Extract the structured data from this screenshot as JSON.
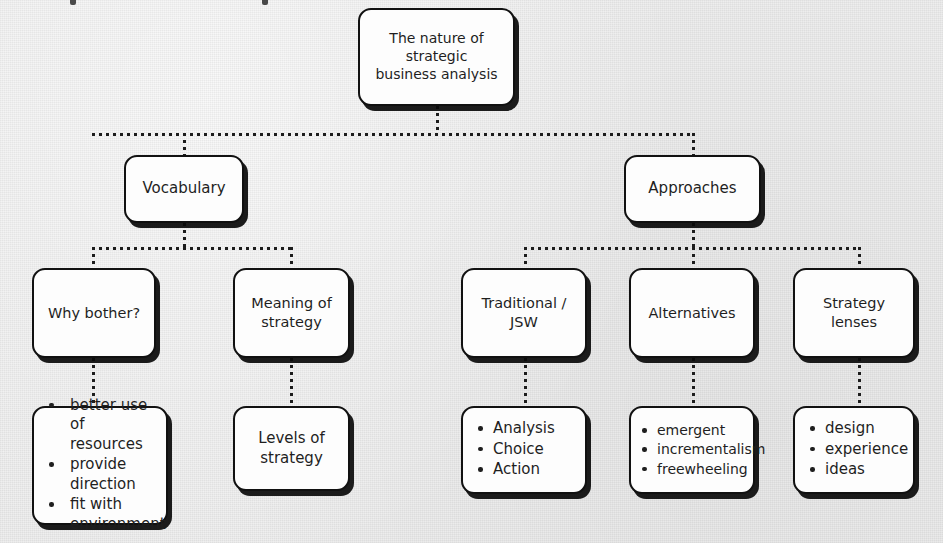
{
  "diagram": {
    "background_color": "#ededed",
    "node_fill": "#fdfdfd",
    "node_border_color": "#111111",
    "connector_style": "dotted",
    "root": {
      "label": "The nature of\nstrategic\nbusiness analysis"
    },
    "branches": {
      "vocabulary": {
        "label": "Vocabulary"
      },
      "approaches": {
        "label": "Approaches"
      }
    },
    "level3": {
      "why_bother": {
        "label": "Why bother?"
      },
      "meaning_of_strategy": {
        "label": "Meaning of\nstrategy"
      },
      "traditional_jsw": {
        "label": "Traditional / JSW"
      },
      "alternatives": {
        "label": "Alternatives"
      },
      "strategy_lenses": {
        "label": "Strategy lenses"
      }
    },
    "leaves": {
      "why_bother_points": {
        "items": [
          "better use of resources",
          "provide direction",
          "fit with environment"
        ]
      },
      "levels_of_strategy": {
        "label": "Levels of\nstrategy"
      },
      "traditional_points": {
        "items": [
          "Analysis",
          "Choice",
          "Action"
        ]
      },
      "alternatives_points": {
        "items": [
          "emergent",
          "incrementalism",
          "freewheeling"
        ]
      },
      "strategy_lenses_points": {
        "items": [
          "design",
          "experience",
          "ideas"
        ]
      }
    }
  }
}
